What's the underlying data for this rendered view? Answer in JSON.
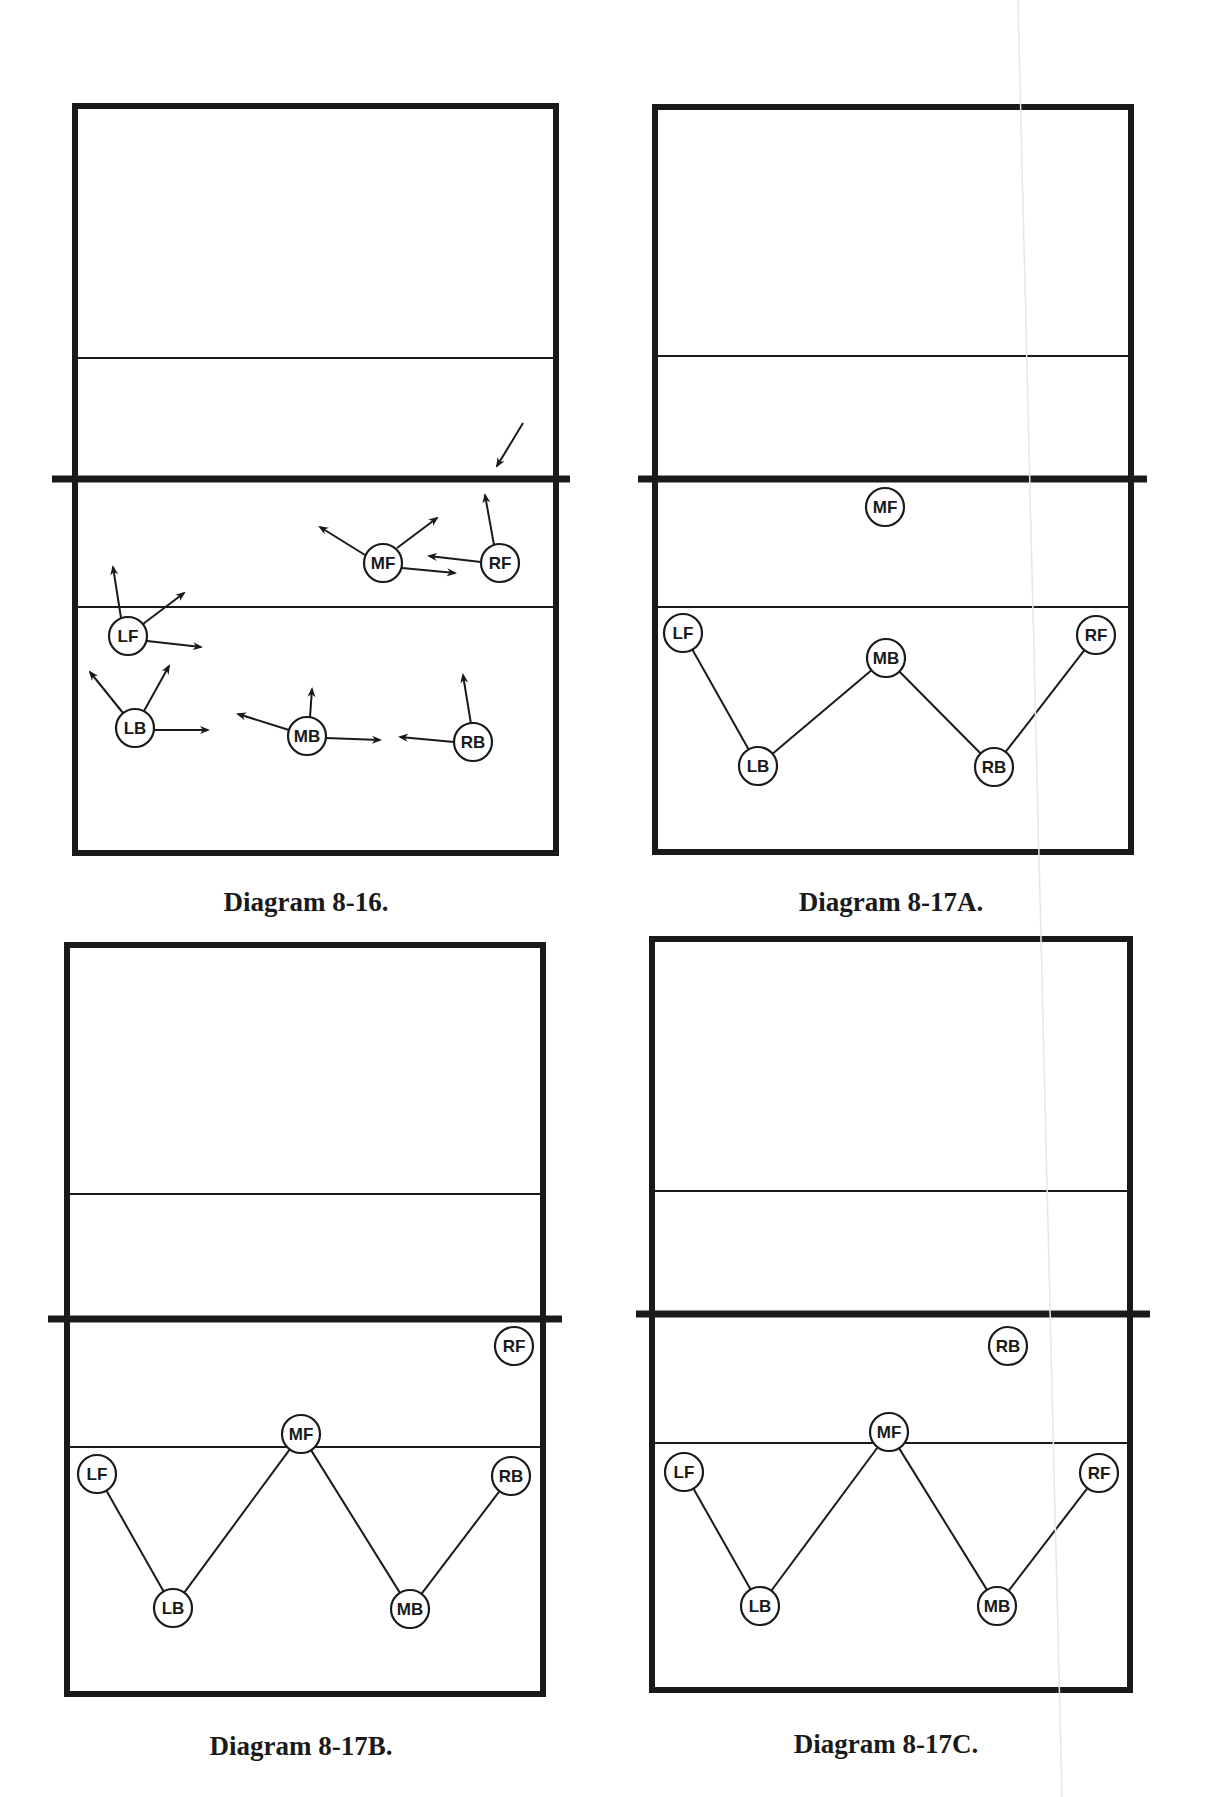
{
  "page": {
    "background": "#ffffff",
    "ink_color": "#1a1a1a"
  },
  "diagrams": [
    {
      "id": "diagram-8-16",
      "caption": "Diagram 8-16.",
      "caption_pos": [
        306,
        889
      ],
      "court": {
        "left": 75,
        "top": 106,
        "right": 556,
        "bottom": 853
      },
      "net": {
        "y": 479,
        "x1": 52,
        "x2": 570
      },
      "attack_lines": [
        358,
        607
      ],
      "players": [
        {
          "label": "MF",
          "x": 383,
          "y": 563
        },
        {
          "label": "RF",
          "x": 500,
          "y": 563
        },
        {
          "label": "LF",
          "x": 128,
          "y": 636
        },
        {
          "label": "LB",
          "x": 135,
          "y": 728
        },
        {
          "label": "MB",
          "x": 307,
          "y": 736
        },
        {
          "label": "RB",
          "x": 473,
          "y": 742
        }
      ],
      "connections": [],
      "arrows": [
        {
          "name": "incoming-ball-arrow",
          "from": [
            523,
            423
          ],
          "to": [
            497,
            466
          ]
        },
        {
          "name": "mf-arrow-up-left",
          "from": [
            365,
            555
          ],
          "to": [
            320,
            527
          ]
        },
        {
          "name": "mf-arrow-up-right",
          "from": [
            397,
            548
          ],
          "to": [
            437,
            518
          ]
        },
        {
          "name": "mf-arrow-right",
          "from": [
            402,
            568
          ],
          "to": [
            455,
            573
          ]
        },
        {
          "name": "rf-arrow-left",
          "from": [
            481,
            562
          ],
          "to": [
            429,
            556
          ]
        },
        {
          "name": "rf-arrow-up",
          "from": [
            494,
            545
          ],
          "to": [
            485,
            495
          ]
        },
        {
          "name": "lf-arrow-up",
          "from": [
            121,
            618
          ],
          "to": [
            113,
            567
          ]
        },
        {
          "name": "lf-arrow-up-right",
          "from": [
            143,
            624
          ],
          "to": [
            184,
            593
          ]
        },
        {
          "name": "lf-arrow-right",
          "from": [
            147,
            641
          ],
          "to": [
            201,
            647
          ]
        },
        {
          "name": "lb-arrow-up-left",
          "from": [
            123,
            713
          ],
          "to": [
            90,
            672
          ]
        },
        {
          "name": "lb-arrow-up-right",
          "from": [
            144,
            711
          ],
          "to": [
            169,
            666
          ]
        },
        {
          "name": "lb-arrow-right",
          "from": [
            154,
            730
          ],
          "to": [
            208,
            730
          ]
        },
        {
          "name": "mb-arrow-up-left",
          "from": [
            289,
            730
          ],
          "to": [
            238,
            714
          ]
        },
        {
          "name": "mb-arrow-up",
          "from": [
            310,
            717
          ],
          "to": [
            312,
            689
          ]
        },
        {
          "name": "mb-arrow-right",
          "from": [
            326,
            738
          ],
          "to": [
            380,
            740
          ]
        },
        {
          "name": "rb-arrow-left",
          "from": [
            454,
            742
          ],
          "to": [
            400,
            737
          ]
        },
        {
          "name": "rb-arrow-up",
          "from": [
            471,
            724
          ],
          "to": [
            463,
            675
          ]
        }
      ]
    },
    {
      "id": "diagram-8-17a",
      "caption": "Diagram 8-17A.",
      "caption_pos": [
        891,
        889
      ],
      "court": {
        "left": 655,
        "top": 107,
        "right": 1131,
        "bottom": 852
      },
      "net": {
        "y": 479,
        "x1": 638,
        "x2": 1147
      },
      "attack_lines": [
        356,
        607
      ],
      "players": [
        {
          "label": "MF",
          "x": 885,
          "y": 507
        },
        {
          "label": "LF",
          "x": 683,
          "y": 633
        },
        {
          "label": "MB",
          "x": 886,
          "y": 658
        },
        {
          "label": "RF",
          "x": 1096,
          "y": 635
        },
        {
          "label": "LB",
          "x": 758,
          "y": 766
        },
        {
          "label": "RB",
          "x": 994,
          "y": 767
        }
      ],
      "connections": [
        [
          "LF",
          "LB"
        ],
        [
          "LB",
          "MB"
        ],
        [
          "MB",
          "RB"
        ],
        [
          "RB",
          "RF"
        ]
      ],
      "arrows": []
    },
    {
      "id": "diagram-8-17b",
      "caption": "Diagram 8-17B.",
      "caption_pos": [
        301,
        1733
      ],
      "court": {
        "left": 67,
        "top": 945,
        "right": 543,
        "bottom": 1694
      },
      "net": {
        "y": 1319,
        "x1": 48,
        "x2": 562
      },
      "attack_lines": [
        1194,
        1447
      ],
      "players": [
        {
          "label": "RF",
          "x": 514,
          "y": 1346
        },
        {
          "label": "MF",
          "x": 301,
          "y": 1434
        },
        {
          "label": "LF",
          "x": 97,
          "y": 1474
        },
        {
          "label": "RB",
          "x": 511,
          "y": 1476
        },
        {
          "label": "LB",
          "x": 173,
          "y": 1608
        },
        {
          "label": "MB",
          "x": 410,
          "y": 1609
        }
      ],
      "connections": [
        [
          "LF",
          "LB"
        ],
        [
          "LB",
          "MF"
        ],
        [
          "MF",
          "MB"
        ],
        [
          "MB",
          "RB"
        ]
      ],
      "arrows": []
    },
    {
      "id": "diagram-8-17c",
      "caption": "Diagram 8-17C.",
      "caption_pos": [
        886,
        1731
      ],
      "court": {
        "left": 652,
        "top": 939,
        "right": 1130,
        "bottom": 1690
      },
      "net": {
        "y": 1314,
        "x1": 636,
        "x2": 1150
      },
      "attack_lines": [
        1191,
        1443
      ],
      "players": [
        {
          "label": "RB",
          "x": 1008,
          "y": 1346
        },
        {
          "label": "MF",
          "x": 889,
          "y": 1432
        },
        {
          "label": "LF",
          "x": 684,
          "y": 1472
        },
        {
          "label": "RF",
          "x": 1099,
          "y": 1473
        },
        {
          "label": "LB",
          "x": 760,
          "y": 1606
        },
        {
          "label": "MB",
          "x": 997,
          "y": 1606
        }
      ],
      "connections": [
        [
          "LF",
          "LB"
        ],
        [
          "LB",
          "MF"
        ],
        [
          "MF",
          "MB"
        ],
        [
          "MB",
          "RF"
        ]
      ],
      "arrows": []
    }
  ],
  "style": {
    "player_radius": 19,
    "court_stroke": 6,
    "net_stroke": 7,
    "attack_line_stroke": 2,
    "connection_stroke": 2,
    "arrow_stroke": 2
  }
}
